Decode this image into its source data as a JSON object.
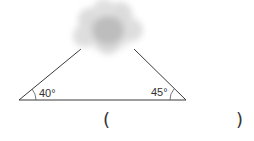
{
  "diagram": {
    "type": "triangle-with-cloud-obscured-apex",
    "left_angle": {
      "label": "40°"
    },
    "right_angle": {
      "label": "45°"
    },
    "answer_blank": {
      "open": "(",
      "close": ")"
    },
    "colors": {
      "line": "#3a3a3a",
      "text": "#333333",
      "cloud": "#b8b8b8"
    }
  }
}
